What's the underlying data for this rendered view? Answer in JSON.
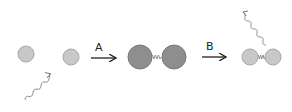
{
  "diagram": {
    "steps": [
      {
        "label": "A",
        "description": "photon absorbed; two separate atoms bind into excited molecule"
      },
      {
        "label": "B",
        "description": "molecule emits photon and relaxes"
      }
    ],
    "colors": {
      "light_atom": "#c8c8c8",
      "light_atom_stroke": "#a8a8a8",
      "dark_atom": "#8e8e8e",
      "dark_atom_stroke": "#7a7a7a",
      "arrow": "#222222",
      "photon": "#888888"
    },
    "elements": {
      "initial_atoms": 2,
      "incoming_photon": "wavy-arrow-in",
      "excited_molecule": "dumbbell-dark",
      "final_molecule": "dumbbell-light",
      "outgoing_photon": "wavy-arrow-out"
    }
  }
}
